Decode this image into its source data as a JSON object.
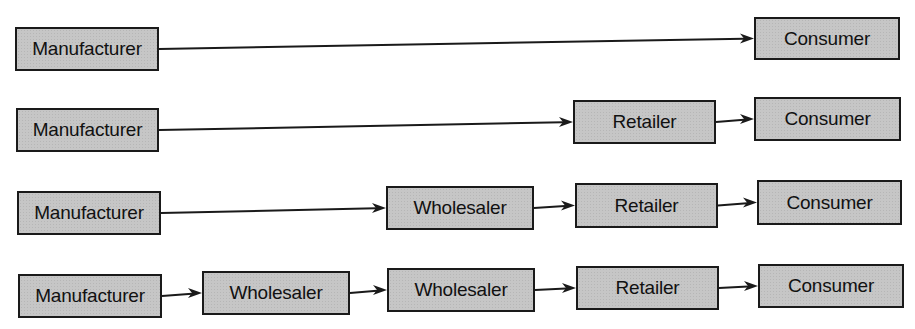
{
  "diagram": {
    "type": "distribution-channels",
    "colors": {
      "box_fill": "#c6c6c6",
      "box_border": "#1a1a1a",
      "arrow": "#1a1a1a",
      "background": "#ffffff"
    },
    "rows": [
      {
        "id": "channel-1",
        "nodes": [
          {
            "label": "Manufacturer",
            "x": 15,
            "y": 27,
            "w": 144,
            "h": 44
          },
          {
            "label": "Consumer",
            "x": 754,
            "y": 17,
            "w": 146,
            "h": 43
          }
        ]
      },
      {
        "id": "channel-2",
        "nodes": [
          {
            "label": "Manufacturer",
            "x": 16,
            "y": 108,
            "w": 143,
            "h": 44
          },
          {
            "label": "Retailer",
            "x": 573,
            "y": 100,
            "w": 143,
            "h": 44
          },
          {
            "label": "Consumer",
            "x": 754,
            "y": 97,
            "w": 147,
            "h": 44
          }
        ]
      },
      {
        "id": "channel-3",
        "nodes": [
          {
            "label": "Manufacturer",
            "x": 17,
            "y": 191,
            "w": 144,
            "h": 44
          },
          {
            "label": "Wholesaler",
            "x": 386,
            "y": 186,
            "w": 148,
            "h": 44
          },
          {
            "label": "Retailer",
            "x": 575,
            "y": 183,
            "w": 143,
            "h": 45
          },
          {
            "label": "Consumer",
            "x": 757,
            "y": 180,
            "w": 145,
            "h": 45
          }
        ]
      },
      {
        "id": "channel-4",
        "nodes": [
          {
            "label": "Manufacturer",
            "x": 18,
            "y": 274,
            "w": 144,
            "h": 44
          },
          {
            "label": "Wholesaler",
            "x": 202,
            "y": 271,
            "w": 148,
            "h": 44
          },
          {
            "label": "Wholesaler",
            "x": 387,
            "y": 268,
            "w": 148,
            "h": 44
          },
          {
            "label": "Retailer",
            "x": 576,
            "y": 266,
            "w": 143,
            "h": 44
          },
          {
            "label": "Consumer",
            "x": 758,
            "y": 264,
            "w": 146,
            "h": 44
          }
        ]
      }
    ]
  }
}
